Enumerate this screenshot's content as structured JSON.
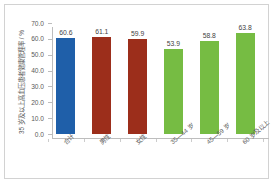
{
  "chart_data": {
    "type": "bar",
    "title": "",
    "subtitle": "",
    "xlabel": "",
    "ylabel": "35 岁及以上高血压患者健康管理率 / %",
    "categories": [
      "合计",
      "男性",
      "女性",
      "35—44 岁",
      "45—59 岁",
      "60 岁及以上"
    ],
    "values": [
      60.6,
      61.1,
      59.9,
      53.9,
      58.8,
      63.8
    ],
    "value_labels": [
      "60.6",
      "61.1",
      "59.9",
      "53.9",
      "58.8",
      "63.8"
    ],
    "bar_colors": [
      "#1f5fa9",
      "#9c2e1b",
      "#9c2e1b",
      "#76bc43",
      "#76bc43",
      "#76bc43"
    ],
    "ylim": [
      0.0,
      70.0
    ],
    "y_ticks": [
      0.0,
      10.0,
      20.0,
      30.0,
      40.0,
      50.0,
      60.0,
      70.0
    ],
    "y_tick_labels": [
      "0.0",
      "10.0",
      "20.0",
      "30.0",
      "40.0",
      "50.0",
      "60.0",
      "70.0"
    ],
    "grid": false,
    "legend": false,
    "legend_position": "none",
    "axis_color": "#bdbdbd",
    "text_color": "#5a5a5a",
    "frame_color": "#d2d2d2",
    "background": "#ffffff"
  }
}
